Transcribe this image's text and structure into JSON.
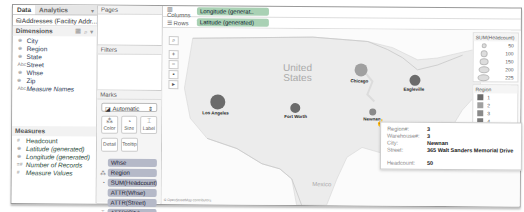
{
  "data_pane": {
    "tabs": [
      {
        "label": "Data"
      },
      {
        "label": "Analytics"
      }
    ],
    "source": "Addresses (Facility Addr...",
    "dimensions_title": "Dimensions",
    "dimensions": [
      {
        "label": "City",
        "icon": "globe-icon"
      },
      {
        "label": "Region",
        "icon": "globe-icon"
      },
      {
        "label": "State",
        "icon": "globe-icon"
      },
      {
        "label": "Street",
        "icon": "abc-icon"
      },
      {
        "label": "Whse",
        "icon": "globe-icon"
      },
      {
        "label": "Zip",
        "icon": "globe-icon"
      },
      {
        "label": "Measure Names",
        "icon": "abc-icon"
      }
    ],
    "measures_title": "Measures",
    "measures": [
      {
        "label": "Headcount",
        "icon": "number-icon"
      },
      {
        "label": "Latitude (generated)",
        "icon": "globe-icon"
      },
      {
        "label": "Longitude (generated)",
        "icon": "globe-icon"
      },
      {
        "label": "Number of Records",
        "icon": "number-icon"
      },
      {
        "label": "Measure Values",
        "icon": "number-icon"
      }
    ]
  },
  "shelves": {
    "pages_title": "Pages",
    "filters_title": "Filters",
    "marks_title": "Marks",
    "mark_type": "Automatic",
    "mark_buttons": [
      "Color",
      "Size",
      "Label",
      "Detail",
      "Tooltip"
    ],
    "mark_pills": [
      {
        "label": "Whse",
        "icon": ""
      },
      {
        "label": "Region",
        "icon": "color-icon"
      },
      {
        "label": "SUM(Headcount)",
        "icon": "size-icon"
      },
      {
        "label": "ATTR(Whse)",
        "icon": ""
      },
      {
        "label": "ATTR(Street)",
        "icon": ""
      },
      {
        "label": "ATTR(City)",
        "icon": "label-icon"
      }
    ]
  },
  "viz": {
    "columns_label": "Columns",
    "columns_pill": "Longitude (generat..",
    "rows_label": "Rows",
    "rows_pill": "Latitude (generated)",
    "country_us": "United\nStates",
    "country_mx": "Mexico",
    "credit": "© OpenStreetMap contributors",
    "cities": [
      {
        "name": "Los Angeles",
        "region": "1"
      },
      {
        "name": "Fort Worth",
        "region": "1"
      },
      {
        "name": "Chicago",
        "region": "2"
      },
      {
        "name": "Eagleville",
        "region": "1"
      },
      {
        "name": "Newnan",
        "region": "3"
      }
    ]
  },
  "legends": {
    "size_title": "SUM(Headcount)",
    "size_values": [
      "50",
      "100",
      "150",
      "200",
      "225"
    ],
    "region_title": "Region",
    "regions": [
      {
        "label": "1",
        "color": "#6b6b6b"
      },
      {
        "label": "2",
        "color": "#a0a0a0"
      },
      {
        "label": "3",
        "color": "#8a8a8a"
      },
      {
        "label": "4",
        "color": "#7a7a7a"
      },
      {
        "label": "5",
        "color": "#5a5a5a"
      }
    ]
  },
  "tooltip": {
    "rows": [
      {
        "key": "Region#:",
        "value": "3"
      },
      {
        "key": "Warehouse#:",
        "value": "3"
      },
      {
        "key": "City:",
        "value": "Newnan"
      },
      {
        "key": "Street:",
        "value": "365 Walt Sanders Memorial Drive"
      }
    ],
    "headcount_key": "Headcount:",
    "headcount_value": "50"
  }
}
